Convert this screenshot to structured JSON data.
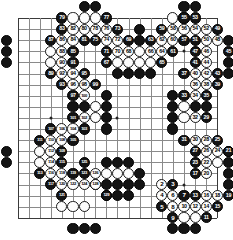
{
  "board": {
    "size": 19,
    "origin_x": 17.5,
    "origin_y": 18.0,
    "step": 11.1,
    "stone_radius": 5.6,
    "line_color": "#8a8a8a",
    "edge_color": "#3a3a3a",
    "background": "#ffffff",
    "black_color": "#141414",
    "white_color": "#fdfdfd",
    "star_points": [
      [
        3,
        3
      ],
      [
        9,
        3
      ],
      [
        15,
        3
      ],
      [
        3,
        9
      ],
      [
        9,
        9
      ],
      [
        15,
        9
      ],
      [
        3,
        15
      ],
      [
        9,
        15
      ],
      [
        15,
        15
      ]
    ]
  },
  "moves": [
    {
      "n": 1,
      "c": "b",
      "x": 7,
      "y": 15
    },
    {
      "n": 2,
      "c": "w",
      "x": 13,
      "y": 15
    },
    {
      "n": 3,
      "c": "b",
      "x": 14,
      "y": 15
    },
    {
      "n": 4,
      "c": "w",
      "x": 13,
      "y": 16
    },
    {
      "n": 5,
      "c": "b",
      "x": 13,
      "y": 17
    },
    {
      "n": 6,
      "c": "w",
      "x": 14,
      "y": 16
    },
    {
      "n": 7,
      "c": "b",
      "x": 15,
      "y": 16
    },
    {
      "n": 8,
      "c": "w",
      "x": 14,
      "y": 17
    },
    {
      "n": 9,
      "c": "b",
      "x": 14,
      "y": 18
    },
    {
      "n": 10,
      "c": "w",
      "x": 15,
      "y": 17
    },
    {
      "n": 11,
      "c": "b",
      "x": 17,
      "y": 18
    },
    {
      "n": 12,
      "c": "w",
      "x": 16,
      "y": 17
    },
    {
      "n": 13,
      "c": "b",
      "x": 16,
      "y": 16
    },
    {
      "n": 14,
      "c": "w",
      "x": 17,
      "y": 17
    },
    {
      "n": 15,
      "c": "b",
      "x": 18,
      "y": 17
    },
    {
      "n": 16,
      "c": "w",
      "x": 17,
      "y": 16
    },
    {
      "n": 17,
      "c": "b",
      "x": 16,
      "y": 14
    },
    {
      "n": 18,
      "c": "w",
      "x": 18,
      "y": 16
    },
    {
      "n": 19,
      "c": "b",
      "x": 19,
      "y": 16
    },
    {
      "n": 20,
      "c": "w",
      "x": 17,
      "y": 14
    },
    {
      "n": 21,
      "c": "b",
      "x": 19,
      "y": 12
    },
    {
      "n": 22,
      "c": "w",
      "x": 17,
      "y": 13
    },
    {
      "n": 23,
      "c": "b",
      "x": 16,
      "y": 13
    },
    {
      "n": 24,
      "c": "w",
      "x": 18,
      "y": 12
    },
    {
      "n": 25,
      "c": "b",
      "x": 18,
      "y": 11
    },
    {
      "n": 26,
      "c": "w",
      "x": 17,
      "y": 12
    },
    {
      "n": 27,
      "c": "b",
      "x": 16,
      "y": 12
    },
    {
      "n": 28,
      "c": "w",
      "x": 17,
      "y": 11
    },
    {
      "n": 29,
      "c": "b",
      "x": 17,
      "y": 9
    },
    {
      "n": 30,
      "c": "w",
      "x": 16,
      "y": 11
    },
    {
      "n": 31,
      "c": "b",
      "x": 15,
      "y": 11
    },
    {
      "n": 32,
      "c": "w",
      "x": 16,
      "y": 9
    },
    {
      "n": 33,
      "c": "b",
      "x": 15,
      "y": 7
    },
    {
      "n": 34,
      "c": "w",
      "x": 16,
      "y": 7
    },
    {
      "n": 35,
      "c": "b",
      "x": 17,
      "y": 7
    },
    {
      "n": 36,
      "c": "w",
      "x": 16,
      "y": 6
    },
    {
      "n": 37,
      "c": "b",
      "x": 15,
      "y": 5
    },
    {
      "n": 38,
      "c": "w",
      "x": 17,
      "y": 6
    },
    {
      "n": 39,
      "c": "b",
      "x": 18,
      "y": 6
    },
    {
      "n": 40,
      "c": "w",
      "x": 16,
      "y": 5
    },
    {
      "n": 41,
      "c": "b",
      "x": 16,
      "y": 4
    },
    {
      "n": 42,
      "c": "w",
      "x": 17,
      "y": 5
    },
    {
      "n": 43,
      "c": "b",
      "x": 18,
      "y": 5
    },
    {
      "n": 44,
      "c": "w",
      "x": 17,
      "y": 4
    },
    {
      "n": 45,
      "c": "b",
      "x": 19,
      "y": 3
    },
    {
      "n": 46,
      "c": "w",
      "x": 17,
      "y": 3
    },
    {
      "n": 47,
      "c": "b",
      "x": 16,
      "y": 3
    },
    {
      "n": 48,
      "c": "w",
      "x": 18,
      "y": 2
    },
    {
      "n": 49,
      "c": "b",
      "x": 18,
      "y": 1
    },
    {
      "n": 50,
      "c": "w",
      "x": 17,
      "y": 2
    },
    {
      "n": 51,
      "c": "b",
      "x": 16,
      "y": 2
    },
    {
      "n": 52,
      "c": "w",
      "x": 17,
      "y": 1
    },
    {
      "n": 53,
      "c": "b",
      "x": 16,
      "y": 0
    },
    {
      "n": 54,
      "c": "w",
      "x": 16,
      "y": 1
    },
    {
      "n": 55,
      "c": "b",
      "x": 15,
      "y": 0
    },
    {
      "n": 56,
      "c": "w",
      "x": 15,
      "y": 1
    },
    {
      "n": 57,
      "c": "b",
      "x": 15,
      "y": 2
    },
    {
      "n": 58,
      "c": "w",
      "x": 14,
      "y": 1
    },
    {
      "n": 59,
      "c": "b",
      "x": 13,
      "y": 1
    },
    {
      "n": 60,
      "c": "w",
      "x": 14,
      "y": 2
    },
    {
      "n": 61,
      "c": "b",
      "x": 14,
      "y": 3
    },
    {
      "n": 62,
      "c": "w",
      "x": 13,
      "y": 2
    },
    {
      "n": 63,
      "c": "b",
      "x": 12,
      "y": 2
    },
    {
      "n": 64,
      "c": "w",
      "x": 13,
      "y": 3
    },
    {
      "n": 65,
      "c": "b",
      "x": 13,
      "y": 4
    },
    {
      "n": 66,
      "c": "w",
      "x": 12,
      "y": 3
    },
    {
      "n": 67,
      "c": "b",
      "x": 8,
      "y": 4
    },
    {
      "n": 68,
      "c": "w",
      "x": 10,
      "y": 3
    },
    {
      "n": 69,
      "c": "b",
      "x": 10,
      "y": 2
    },
    {
      "n": 70,
      "c": "w",
      "x": 9,
      "y": 3
    },
    {
      "n": 71,
      "c": "b",
      "x": 8,
      "y": 3
    },
    {
      "n": 72,
      "c": "w",
      "x": 9,
      "y": 2
    },
    {
      "n": 73,
      "c": "b",
      "x": 9,
      "y": 1
    },
    {
      "n": 74,
      "c": "w",
      "x": 8,
      "y": 2
    },
    {
      "n": 75,
      "c": "b",
      "x": 7,
      "y": 2
    },
    {
      "n": 76,
      "c": "w",
      "x": 8,
      "y": 1
    },
    {
      "n": 77,
      "c": "b",
      "x": 8,
      "y": 0
    },
    {
      "n": 78,
      "c": "w",
      "x": 7,
      "y": 1
    },
    {
      "n": 79,
      "c": "b",
      "x": 4,
      "y": 0
    },
    {
      "n": 80,
      "c": "w",
      "x": 6,
      "y": 1
    },
    {
      "n": 81,
      "c": "b",
      "x": 6,
      "y": 2
    },
    {
      "n": 82,
      "c": "w",
      "x": 5,
      "y": 1
    },
    {
      "n": 83,
      "c": "b",
      "x": 4,
      "y": 1
    },
    {
      "n": 84,
      "c": "w",
      "x": 5,
      "y": 2
    },
    {
      "n": 85,
      "c": "b",
      "x": 5,
      "y": 3
    },
    {
      "n": 86,
      "c": "w",
      "x": 4,
      "y": 2
    },
    {
      "n": 87,
      "c": "b",
      "x": 3,
      "y": 2
    },
    {
      "n": 88,
      "c": "w",
      "x": 4,
      "y": 3
    },
    {
      "n": 89,
      "c": "b",
      "x": 3,
      "y": 5
    },
    {
      "n": 90,
      "c": "w",
      "x": 4,
      "y": 4
    },
    {
      "n": 91,
      "c": "b",
      "x": 5,
      "y": 4
    },
    {
      "n": 92,
      "c": "w",
      "x": 4,
      "y": 5
    },
    {
      "n": 93,
      "c": "b",
      "x": 4,
      "y": 6
    },
    {
      "n": 94,
      "c": "w",
      "x": 5,
      "y": 5
    },
    {
      "n": 95,
      "c": "b",
      "x": 6,
      "y": 5
    },
    {
      "n": 96,
      "c": "w",
      "x": 5,
      "y": 6
    },
    {
      "n": 97,
      "c": "b",
      "x": 5,
      "y": 7
    },
    {
      "n": 98,
      "c": "w",
      "x": 6,
      "y": 6
    },
    {
      "n": 99,
      "c": "b",
      "x": 7,
      "y": 6
    },
    {
      "n": 100,
      "c": "w",
      "x": 6,
      "y": 7
    },
    {
      "n": 101,
      "c": "b",
      "x": 5,
      "y": 9
    },
    {
      "n": 102,
      "c": "w",
      "x": 6,
      "y": 9
    },
    {
      "n": 103,
      "c": "b",
      "x": 6,
      "y": 10
    },
    {
      "n": 104,
      "c": "w",
      "x": 5,
      "y": 10
    },
    {
      "n": 105,
      "c": "b",
      "x": 5,
      "y": 11
    },
    {
      "n": 106,
      "c": "w",
      "x": 4,
      "y": 10
    },
    {
      "n": 107,
      "c": "b",
      "x": 3,
      "y": 10
    },
    {
      "n": 108,
      "c": "w",
      "x": 4,
      "y": 11
    },
    {
      "n": 109,
      "c": "b",
      "x": 4,
      "y": 12
    },
    {
      "n": 110,
      "c": "w",
      "x": 3,
      "y": 11
    },
    {
      "n": 111,
      "c": "b",
      "x": 2,
      "y": 11
    },
    {
      "n": 112,
      "c": "w",
      "x": 3,
      "y": 12
    },
    {
      "n": 113,
      "c": "b",
      "x": 2,
      "y": 14
    },
    {
      "n": 114,
      "c": "w",
      "x": 3,
      "y": 13
    },
    {
      "n": 115,
      "c": "b",
      "x": 4,
      "y": 13
    },
    {
      "n": 116,
      "c": "w",
      "x": 3,
      "y": 14
    },
    {
      "n": 117,
      "c": "b",
      "x": 3,
      "y": 15
    },
    {
      "n": 118,
      "c": "w",
      "x": 4,
      "y": 14
    },
    {
      "n": 119,
      "c": "b",
      "x": 5,
      "y": 14
    },
    {
      "n": 120,
      "c": "w",
      "x": 4,
      "y": 15
    },
    {
      "n": 121,
      "c": "b",
      "x": 4,
      "y": 16
    },
    {
      "n": 122,
      "c": "w",
      "x": 5,
      "y": 15
    },
    {
      "n": 123,
      "c": "b",
      "x": 6,
      "y": 14
    },
    {
      "n": 124,
      "c": "w",
      "x": 6,
      "y": 15
    },
    {
      "n": 125,
      "c": "b",
      "x": 6,
      "y": 13
    },
    {
      "n": 126,
      "c": "w",
      "x": 7,
      "y": 14
    },
    {
      "n": 127,
      "c": "b",
      "x": 7,
      "y": 15
    },
    {
      "n": 128,
      "c": "w",
      "x": 7,
      "y": 15
    },
    {
      "n": 129,
      "c": "b",
      "x": 8,
      "y": 16
    }
  ],
  "plain_stones": [
    {
      "c": "b",
      "x": 6,
      "y": -1
    },
    {
      "c": "b",
      "x": 7,
      "y": -1
    },
    {
      "c": "b",
      "x": 15,
      "y": -1
    },
    {
      "c": "b",
      "x": 16,
      "y": -1
    },
    {
      "c": "w",
      "x": 5,
      "y": 0
    },
    {
      "c": "w",
      "x": 6,
      "y": 0
    },
    {
      "c": "w",
      "x": 7,
      "y": 0
    },
    {
      "c": "w",
      "x": 14,
      "y": 0
    },
    {
      "c": "w",
      "x": 15,
      "y": 0
    },
    {
      "c": "b",
      "x": -1,
      "y": 2
    },
    {
      "c": "b",
      "x": -1,
      "y": 3
    },
    {
      "c": "b",
      "x": -1,
      "y": 4
    },
    {
      "c": "w",
      "x": 3,
      "y": 3
    },
    {
      "c": "w",
      "x": 3,
      "y": 4
    },
    {
      "c": "b",
      "x": 11,
      "y": 2
    },
    {
      "c": "b",
      "x": 11,
      "y": 1
    },
    {
      "c": "w",
      "x": 11,
      "y": 3
    },
    {
      "c": "w",
      "x": 10,
      "y": 4
    },
    {
      "c": "w",
      "x": 11,
      "y": 4
    },
    {
      "c": "w",
      "x": 12,
      "y": 4
    },
    {
      "c": "w",
      "x": 9,
      "y": 4
    },
    {
      "c": "b",
      "x": 9,
      "y": 5
    },
    {
      "c": "b",
      "x": 10,
      "y": 5
    },
    {
      "c": "b",
      "x": 11,
      "y": 5
    },
    {
      "c": "b",
      "x": 12,
      "y": 5
    },
    {
      "c": "b",
      "x": 19,
      "y": 2
    },
    {
      "c": "b",
      "x": 19,
      "y": 4
    },
    {
      "c": "b",
      "x": 19,
      "y": 5
    },
    {
      "c": "b",
      "x": 14,
      "y": 7
    },
    {
      "c": "b",
      "x": 14,
      "y": 8
    },
    {
      "c": "b",
      "x": 14,
      "y": 9
    },
    {
      "c": "b",
      "x": 14,
      "y": 10
    },
    {
      "c": "w",
      "x": 15,
      "y": 8
    },
    {
      "c": "w",
      "x": 15,
      "y": 9
    },
    {
      "c": "b",
      "x": 16,
      "y": 8
    },
    {
      "c": "b",
      "x": 17,
      "y": 8
    },
    {
      "c": "b",
      "x": 8,
      "y": 7
    },
    {
      "c": "b",
      "x": 8,
      "y": 8
    },
    {
      "c": "b",
      "x": 8,
      "y": 9
    },
    {
      "c": "b",
      "x": 8,
      "y": 10
    },
    {
      "c": "w",
      "x": 7,
      "y": 8
    },
    {
      "c": "w",
      "x": 7,
      "y": 9
    },
    {
      "c": "b",
      "x": 6,
      "y": 8
    },
    {
      "c": "b",
      "x": 5,
      "y": 8
    },
    {
      "c": "b",
      "x": -1,
      "y": 12
    },
    {
      "c": "b",
      "x": -1,
      "y": 13
    },
    {
      "c": "w",
      "x": 2,
      "y": 12
    },
    {
      "c": "w",
      "x": 2,
      "y": 13
    },
    {
      "c": "b",
      "x": 19,
      "y": 12
    },
    {
      "c": "b",
      "x": 19,
      "y": 13
    },
    {
      "c": "w",
      "x": 18,
      "y": 13
    },
    {
      "c": "b",
      "x": 8,
      "y": 13
    },
    {
      "c": "b",
      "x": 9,
      "y": 13
    },
    {
      "c": "b",
      "x": 10,
      "y": 13
    },
    {
      "c": "w",
      "x": 8,
      "y": 14
    },
    {
      "c": "w",
      "x": 9,
      "y": 14
    },
    {
      "c": "w",
      "x": 10,
      "y": 14
    },
    {
      "c": "b",
      "x": 11,
      "y": 14
    },
    {
      "c": "b",
      "x": 8,
      "y": 15
    },
    {
      "c": "b",
      "x": 9,
      "y": 15
    },
    {
      "c": "b",
      "x": 10,
      "y": 15
    },
    {
      "c": "b",
      "x": 11,
      "y": 15
    },
    {
      "c": "b",
      "x": 8,
      "y": 16
    },
    {
      "c": "b",
      "x": 9,
      "y": 16
    },
    {
      "c": "b",
      "x": 10,
      "y": 16
    },
    {
      "c": "w",
      "x": 4,
      "y": 17
    },
    {
      "c": "w",
      "x": 5,
      "y": 17
    },
    {
      "c": "w",
      "x": 6,
      "y": 17
    },
    {
      "c": "b",
      "x": 5,
      "y": 19
    },
    {
      "c": "b",
      "x": 6,
      "y": 19
    },
    {
      "c": "b",
      "x": 7,
      "y": 19
    },
    {
      "c": "w",
      "x": 15,
      "y": 18
    },
    {
      "c": "w",
      "x": 16,
      "y": 18
    },
    {
      "c": "b",
      "x": 14,
      "y": 19
    },
    {
      "c": "b",
      "x": 15,
      "y": 19
    },
    {
      "c": "b",
      "x": 16,
      "y": 19
    },
    {
      "c": "b",
      "x": 19,
      "y": 15
    },
    {
      "c": "b",
      "x": 19,
      "y": 14
    }
  ]
}
